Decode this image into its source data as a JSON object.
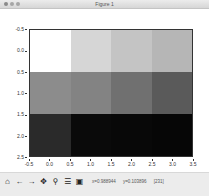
{
  "window": {
    "title": "Figure 1"
  },
  "toolbar": {
    "icons": [
      {
        "name": "home-icon",
        "glyph": "⌂"
      },
      {
        "name": "back-icon",
        "glyph": "←"
      },
      {
        "name": "forward-icon",
        "glyph": "→"
      },
      {
        "name": "pan-icon",
        "glyph": "✥"
      },
      {
        "name": "zoom-icon",
        "glyph": "⚲"
      },
      {
        "name": "configure-subplots-icon",
        "glyph": "☰"
      },
      {
        "name": "save-icon",
        "glyph": "▣"
      }
    ],
    "coords": {
      "x": "x=0.988944",
      "y": "y=0.103896",
      "value": "[231]"
    }
  },
  "chart_data": {
    "type": "heatmap",
    "title": "",
    "xlabel": "",
    "ylabel": "",
    "colormap": "gray",
    "rows": 3,
    "cols": 4,
    "values_gray_hex": [
      [
        "#ffffff",
        "#d6d6d6",
        "#c4c4c4",
        "#b6b6b6"
      ],
      [
        "#8c8c8c",
        "#838383",
        "#707070",
        "#5a5a5a"
      ],
      [
        "#2a2a2a",
        "#0a0a0a",
        "#080808",
        "#060606"
      ]
    ],
    "xlim": [
      -0.5,
      3.5
    ],
    "ylim": [
      2.5,
      -0.5
    ],
    "xticks": [
      "-0.5",
      "0.0",
      "0.5",
      "1.0",
      "1.5",
      "2.0",
      "2.5",
      "3.0",
      "3.5"
    ],
    "yticks": [
      "-0.5",
      "0.0",
      "0.5",
      "1.0",
      "1.5",
      "2.0",
      "2.5"
    ],
    "grid": false,
    "legend": null
  }
}
